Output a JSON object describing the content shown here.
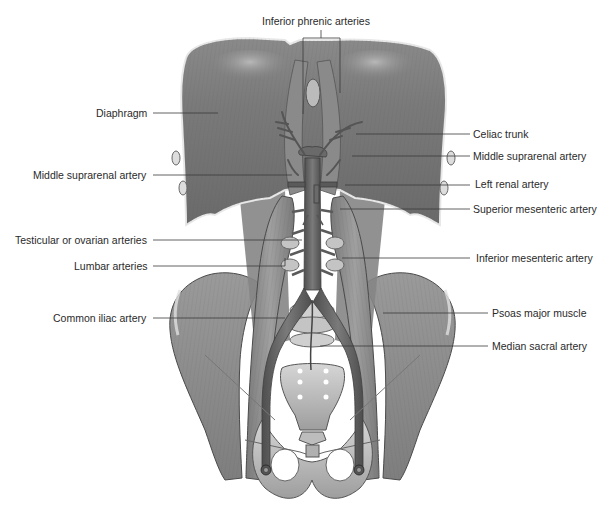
{
  "figure": {
    "colors": {
      "background": "#ffffff",
      "muscle_dark": "#6e6e6e",
      "muscle_mid": "#8c8c8c",
      "muscle_light": "#c4c4c4",
      "bone": "#b8b8b8",
      "bone_light": "#d9d9d9",
      "artery": "#5a5a5a",
      "leader_line": "#3a3a3a",
      "label_text": "#2a2a2a"
    }
  },
  "labels": {
    "inferior_phrenic": "Inferior phrenic arteries",
    "diaphragm": "Diaphragm",
    "middle_suprarenal_left": "Middle suprarenal artery",
    "testicular_ovarian": "Testicular or ovarian arteries",
    "lumbar": "Lumbar arteries",
    "common_iliac": "Common iliac artery",
    "celiac_trunk": "Celiac trunk",
    "middle_suprarenal_right": "Middle suprarenal artery",
    "left_renal": "Left renal artery",
    "superior_mesenteric": "Superior mesenteric artery",
    "inferior_mesenteric": "Inferior mesenteric artery",
    "psoas_major": "Psoas major muscle",
    "median_sacral": "Median sacral artery"
  }
}
